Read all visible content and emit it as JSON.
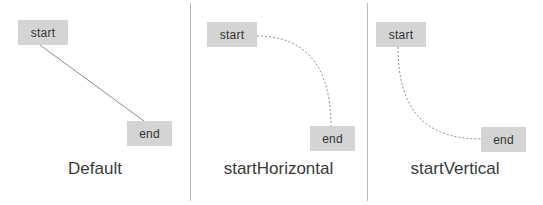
{
  "figure": {
    "background_color": "#ffffff",
    "divider_color": "#b9b9b9",
    "node_fill": "#d4d4d4",
    "node_text_color": "#333333",
    "edge_color": "#8e8e8e",
    "caption_color": "#3a3a3a",
    "divider_x": [
      190,
      367
    ]
  },
  "panels": [
    {
      "id": "default",
      "caption": "Default",
      "caption_y": 160,
      "left": 0,
      "width": 190,
      "start_node": {
        "label": "start",
        "x": 18,
        "y": 20,
        "w": 50,
        "h": 25
      },
      "end_node": {
        "label": "end",
        "x": 127,
        "y": 121,
        "w": 45,
        "h": 25
      },
      "edge": {
        "style": "straight",
        "dashed": false,
        "path": "M 40 45 L 148 124",
        "from_point": [
          40,
          45
        ],
        "to_point": [
          148,
          124
        ]
      }
    },
    {
      "id": "startHorizontal",
      "caption": "startHorizontal",
      "caption_y": 160,
      "left": 190,
      "width": 177,
      "start_node": {
        "label": "start",
        "x": 17,
        "y": 22,
        "w": 50,
        "h": 25
      },
      "end_node": {
        "label": "end",
        "x": 120,
        "y": 126,
        "w": 45,
        "h": 25
      },
      "edge": {
        "style": "curve",
        "dashed": true,
        "path": "M 67 36 C 110 36 141 60 141 126",
        "from_point": [
          67,
          36
        ],
        "to_point": [
          141,
          126
        ],
        "start_direction": "horizontal",
        "end_direction": "vertical"
      }
    },
    {
      "id": "startVertical",
      "caption": "startVertical",
      "caption_y": 160,
      "left": 367,
      "width": 176,
      "start_node": {
        "label": "start",
        "x": 9,
        "y": 22,
        "w": 50,
        "h": 25
      },
      "end_node": {
        "label": "end",
        "x": 114,
        "y": 127,
        "w": 45,
        "h": 25
      },
      "edge": {
        "style": "curve",
        "dashed": true,
        "path": "M 31 47 C 31 110 58 139 114 139",
        "from_point": [
          31,
          47
        ],
        "to_point": [
          114,
          139
        ],
        "start_direction": "vertical",
        "end_direction": "horizontal"
      }
    }
  ]
}
